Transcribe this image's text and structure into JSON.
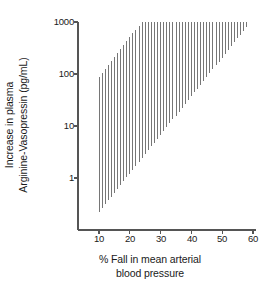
{
  "chart_data": {
    "type": "bar",
    "title": "",
    "subtitle": "",
    "xlabel_lines": [
      "% Fall in mean arterial",
      "blood pressure"
    ],
    "xlabel": "% Fall in mean arterial blood pressure",
    "ylabel_lines": [
      "Increase in plasma",
      "Arginine-Vasopressin (pg/mL)"
    ],
    "ylabel": "Increase in plasma Arginine-Vasopressin (pg/mL)",
    "yscale": "log",
    "xscale": "linear",
    "xlim": [
      7.5,
      61
    ],
    "ylim": [
      0.18,
      1400
    ],
    "grid": false,
    "legend": null,
    "xticks": [
      10,
      20,
      30,
      40,
      50,
      60
    ],
    "xtick_labels": [
      "10",
      "20",
      "30",
      "40",
      "50",
      "60"
    ],
    "yticks": [
      1,
      10,
      100,
      1000
    ],
    "ytick_labels": [
      "1",
      "10",
      "100",
      "1000"
    ],
    "series_name": "AVP response range",
    "bar_color": "#4d4d4d",
    "axis_color": "#555555",
    "note": "Each x position carries one thin vertical line spanning the low-to-high range of plasma AVP at that % fall in MAP.",
    "categories": [
      10,
      11,
      12,
      13,
      14,
      15,
      16,
      17,
      18,
      19,
      20,
      21,
      22,
      23,
      24,
      25,
      26,
      27,
      28,
      29,
      30,
      31,
      32,
      33,
      34,
      35,
      36,
      37,
      38,
      39,
      40,
      41,
      42,
      43,
      44,
      45,
      46,
      47,
      48,
      49,
      50,
      51,
      52,
      53,
      54,
      55,
      56,
      57,
      58
    ],
    "low": [
      0.22,
      0.26,
      0.31,
      0.37,
      0.44,
      0.52,
      0.62,
      0.73,
      0.87,
      1.03,
      1.22,
      1.45,
      1.72,
      2.04,
      2.42,
      2.87,
      3.4,
      4.04,
      4.79,
      5.68,
      6.74,
      8.0,
      9.49,
      11.25,
      13.35,
      15.84,
      18.79,
      22.3,
      26.45,
      31.38,
      37.23,
      44.17,
      52.4,
      62.17,
      73.76,
      87.5,
      103.8,
      123.1,
      146.1,
      173.3,
      205.6,
      243.9,
      289.4,
      343.3,
      407.3,
      483.2,
      573.2,
      680.1,
      806.9
    ],
    "high": [
      88,
      105,
      125,
      149,
      177,
      211,
      251,
      299,
      356,
      424,
      505,
      601,
      715,
      851,
      1000,
      1000,
      1000,
      1000,
      1000,
      1000,
      1000,
      1000,
      1000,
      1000,
      1000,
      1000,
      1000,
      1000,
      1000,
      1000,
      1000,
      1000,
      1000,
      1000,
      1000,
      1000,
      1000,
      1000,
      1000,
      1000,
      1000,
      1000,
      1000,
      1000,
      1000,
      1000,
      1000,
      1000,
      1000
    ]
  }
}
